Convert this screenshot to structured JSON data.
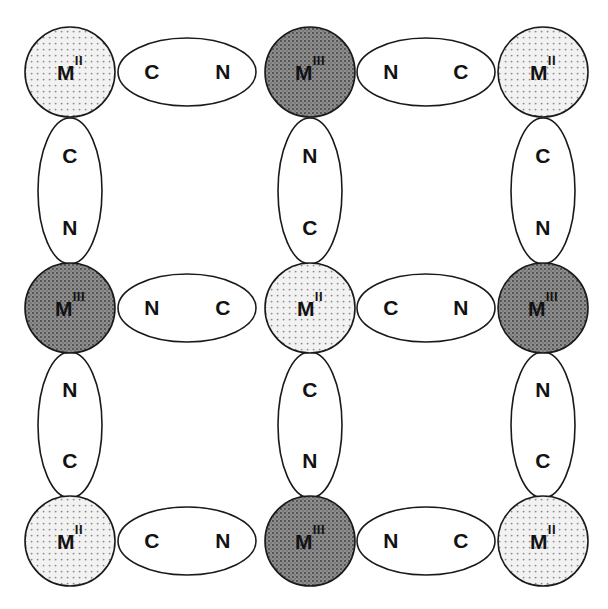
{
  "figure": {
    "type": "lattice-diagram",
    "colors": {
      "background": "#ffffff",
      "stroke": "#1a1a1a",
      "metal_light_fill": "#ededed",
      "metal_light_dot": "#8d8d8d",
      "metal_dark_fill": "#8c8c8c",
      "metal_dark_dot": "#4a4a4a",
      "bridge_fill": "#ffffff",
      "text": "#121212"
    },
    "geometry": {
      "metal_radius": 45,
      "h_bridge_rx": 69,
      "h_bridge_ry": 34,
      "v_bridge_rx": 32,
      "v_bridge_ry": 73,
      "col_x": [
        70,
        310,
        543
      ],
      "row_y": [
        72,
        308,
        541
      ]
    }
  },
  "metals": [
    {
      "id": "m-r0-c0",
      "label": "M",
      "oxidation": "II",
      "shade": "light",
      "row": 0,
      "col": 0,
      "cx": 70,
      "cy": 72
    },
    {
      "id": "m-r0-c1",
      "label": "M",
      "oxidation": "III",
      "shade": "dark",
      "row": 0,
      "col": 1,
      "cx": 310,
      "cy": 72
    },
    {
      "id": "m-r0-c2",
      "label": "M",
      "oxidation": "II",
      "shade": "light",
      "row": 0,
      "col": 2,
      "cx": 543,
      "cy": 72
    },
    {
      "id": "m-r1-c0",
      "label": "M",
      "oxidation": "III",
      "shade": "dark",
      "row": 1,
      "col": 0,
      "cx": 70,
      "cy": 308
    },
    {
      "id": "m-r1-c1",
      "label": "M",
      "oxidation": "II",
      "shade": "light",
      "row": 1,
      "col": 1,
      "cx": 310,
      "cy": 308
    },
    {
      "id": "m-r1-c2",
      "label": "M",
      "oxidation": "III",
      "shade": "dark",
      "row": 1,
      "col": 2,
      "cx": 543,
      "cy": 308
    },
    {
      "id": "m-r2-c0",
      "label": "M",
      "oxidation": "II",
      "shade": "light",
      "row": 2,
      "col": 0,
      "cx": 70,
      "cy": 541
    },
    {
      "id": "m-r2-c1",
      "label": "M",
      "oxidation": "III",
      "shade": "dark",
      "row": 2,
      "col": 1,
      "cx": 310,
      "cy": 541
    },
    {
      "id": "m-r2-c2",
      "label": "M",
      "oxidation": "II",
      "shade": "light",
      "row": 2,
      "col": 2,
      "cx": 543,
      "cy": 541
    }
  ],
  "bridges_horizontal": [
    {
      "id": "h-r0-c0",
      "cx": 187,
      "cy": 72,
      "left_atom": "C",
      "right_atom": "N",
      "left_x": 152,
      "right_x": 223
    },
    {
      "id": "h-r0-c1",
      "cx": 426,
      "cy": 72,
      "left_atom": "N",
      "right_atom": "C",
      "left_x": 391,
      "right_x": 461
    },
    {
      "id": "h-r1-c0",
      "cx": 187,
      "cy": 308,
      "left_atom": "N",
      "right_atom": "C",
      "left_x": 152,
      "right_x": 223
    },
    {
      "id": "h-r1-c1",
      "cx": 426,
      "cy": 308,
      "left_atom": "C",
      "right_atom": "N",
      "left_x": 391,
      "right_x": 461
    },
    {
      "id": "h-r2-c0",
      "cx": 187,
      "cy": 541,
      "left_atom": "C",
      "right_atom": "N",
      "left_x": 152,
      "right_x": 223
    },
    {
      "id": "h-r2-c1",
      "cx": 426,
      "cy": 541,
      "left_atom": "N",
      "right_atom": "C",
      "left_x": 391,
      "right_x": 461
    }
  ],
  "bridges_vertical": [
    {
      "id": "v-c0-r0",
      "cx": 70,
      "cy": 191,
      "top_atom": "C",
      "bottom_atom": "N",
      "top_y": 156,
      "bottom_y": 228
    },
    {
      "id": "v-c1-r0",
      "cx": 310,
      "cy": 191,
      "top_atom": "N",
      "bottom_atom": "C",
      "top_y": 156,
      "bottom_y": 228
    },
    {
      "id": "v-c2-r0",
      "cx": 543,
      "cy": 191,
      "top_atom": "C",
      "bottom_atom": "N",
      "top_y": 156,
      "bottom_y": 228
    },
    {
      "id": "v-c0-r1",
      "cx": 70,
      "cy": 425,
      "top_atom": "N",
      "bottom_atom": "C",
      "top_y": 390,
      "bottom_y": 461
    },
    {
      "id": "v-c1-r1",
      "cx": 310,
      "cy": 425,
      "top_atom": "C",
      "bottom_atom": "N",
      "top_y": 390,
      "bottom_y": 461
    },
    {
      "id": "v-c2-r1",
      "cx": 543,
      "cy": 425,
      "top_atom": "N",
      "bottom_atom": "C",
      "top_y": 390,
      "bottom_y": 461
    }
  ],
  "labels": {
    "metal_symbol": "M",
    "oxidation_two": "II",
    "oxidation_three": "III",
    "carbon": "C",
    "nitrogen": "N"
  }
}
